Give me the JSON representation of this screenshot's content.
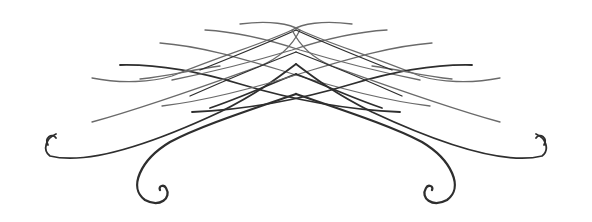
{
  "image": {
    "kind": "decorative-flourish-ornament",
    "width": 592,
    "height": 222,
    "background": "#ffffff",
    "ink_color": "#2e2e2e"
  }
}
